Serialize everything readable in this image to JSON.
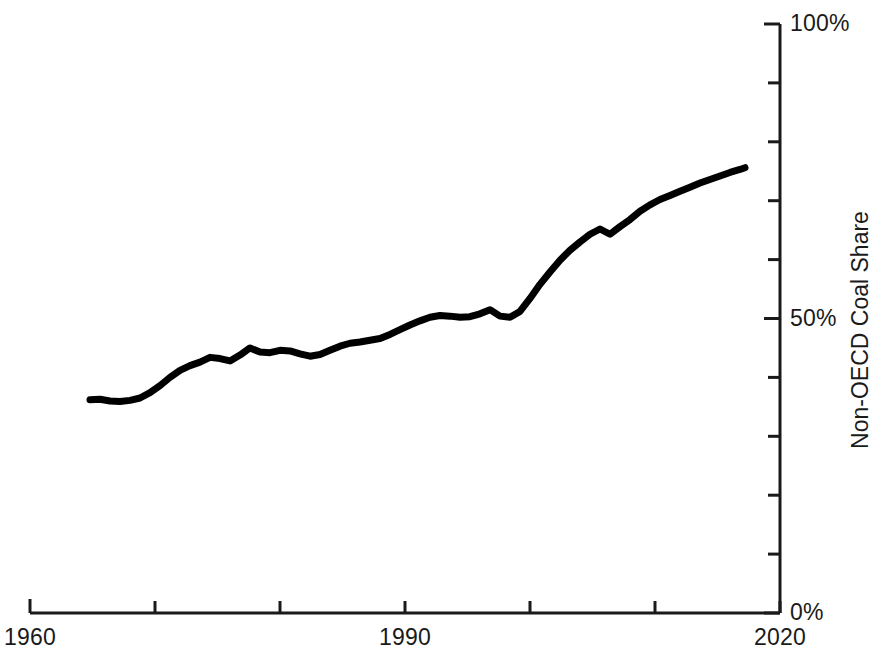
{
  "chart_data": {
    "type": "line",
    "title": "",
    "xlabel": "",
    "ylabel": "Non-OECD Coal Share",
    "xlim": [
      1960,
      2020
    ],
    "ylim": [
      0,
      100
    ],
    "y_unit": "%",
    "grid": false,
    "legend": null,
    "x_tick_labels": [
      "1960",
      "1990",
      "2020"
    ],
    "x_ticks": [
      1960,
      1970,
      1980,
      1990,
      2000,
      2010,
      2020
    ],
    "y_tick_labels": [
      "0%",
      "50%",
      "100%"
    ],
    "y_ticks": [
      0,
      10,
      20,
      30,
      40,
      50,
      60,
      70,
      80,
      90,
      100
    ],
    "line_color": "#000000",
    "line_width_px": 7,
    "axis_color": "#1a1a1a",
    "series": [
      {
        "name": "Non-OECD Coal Share",
        "x": [
          1964.8,
          1965.6,
          1966.4,
          1967.2,
          1968.0,
          1968.8,
          1969.6,
          1970.4,
          1971.2,
          1972.0,
          1972.8,
          1973.6,
          1974.4,
          1975.2,
          1976.0,
          1976.8,
          1977.6,
          1978.4,
          1979.2,
          1980.0,
          1980.8,
          1981.6,
          1982.4,
          1983.2,
          1984.0,
          1984.8,
          1985.6,
          1986.4,
          1987.2,
          1988.0,
          1988.8,
          1989.6,
          1990.4,
          1991.2,
          1992.0,
          1992.8,
          1993.6,
          1994.4,
          1995.2,
          1996.0,
          1996.8,
          1997.6,
          1998.4,
          1999.2,
          2000.0,
          2000.8,
          2001.6,
          2002.4,
          2003.2,
          2004.0,
          2004.8,
          2005.6,
          2006.4,
          2007.2,
          2008.0,
          2008.8,
          2009.6,
          2010.4,
          2011.2,
          2012.0,
          2012.8,
          2013.6,
          2014.4,
          2015.2,
          2016.0,
          2016.8,
          2017.2
        ],
        "y": [
          36.2,
          36.3,
          36.0,
          35.9,
          36.1,
          36.5,
          37.4,
          38.6,
          40.0,
          41.2,
          42.0,
          42.6,
          43.4,
          43.2,
          42.8,
          43.8,
          45.0,
          44.3,
          44.2,
          44.6,
          44.5,
          44.0,
          43.6,
          43.9,
          44.6,
          45.3,
          45.8,
          46.0,
          46.3,
          46.6,
          47.3,
          48.1,
          48.9,
          49.6,
          50.2,
          50.5,
          50.4,
          50.2,
          50.3,
          50.8,
          51.5,
          50.4,
          50.2,
          51.2,
          53.4,
          55.8,
          57.9,
          59.9,
          61.6,
          63.0,
          64.3,
          65.2,
          64.3,
          65.6,
          66.8,
          68.2,
          69.3,
          70.2,
          70.9,
          71.6,
          72.3,
          73.0,
          73.6,
          74.2,
          74.8,
          75.3,
          75.6
        ]
      }
    ]
  },
  "axes": {
    "y_axis_position": "right",
    "x_axis_position": "bottom"
  }
}
